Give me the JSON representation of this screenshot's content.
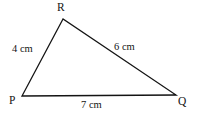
{
  "figure": {
    "type": "geometry-diagram",
    "shape": "triangle",
    "background_color": "#ffffff",
    "stroke_color": "#141414",
    "stroke_width": 1.3,
    "text_color": "#141414",
    "vertices": [
      {
        "id": "R",
        "label": "R",
        "x": 63,
        "y": 19
      },
      {
        "id": "P",
        "label": "P",
        "x": 22,
        "y": 96
      },
      {
        "id": "Q",
        "label": "Q",
        "x": 176,
        "y": 95
      }
    ],
    "sides": [
      {
        "id": "PR",
        "from": "P",
        "to": "R",
        "label": "4 cm",
        "length": 4,
        "unit": "cm"
      },
      {
        "id": "RQ",
        "from": "R",
        "to": "Q",
        "label": "6 cm",
        "length": 6,
        "unit": "cm"
      },
      {
        "id": "PQ",
        "from": "P",
        "to": "Q",
        "label": "7 cm",
        "length": 7,
        "unit": "cm"
      }
    ]
  }
}
